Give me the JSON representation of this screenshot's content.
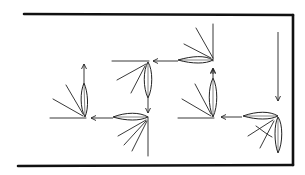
{
  "diagram": {
    "type": "path-diagram",
    "colors": {
      "ink": "#222222",
      "frame": "#111111",
      "background": "#ffffff"
    },
    "frame": {
      "sides": [
        "top",
        "right",
        "bottom"
      ],
      "open_side": "left"
    },
    "nodes": [
      {
        "id": "leaf-1",
        "orientation": "horizontal",
        "pivot": [
          213,
          60
        ],
        "arrow_direction": "left",
        "rays": 2
      },
      {
        "id": "leaf-2",
        "orientation": "vertical-down",
        "pivot": [
          148,
          62
        ],
        "arrow_direction": "down",
        "rays": 2
      },
      {
        "id": "leaf-3",
        "orientation": "horizontal",
        "pivot": [
          148,
          117
        ],
        "arrow_direction": "left",
        "rays": 3
      },
      {
        "id": "leaf-4",
        "orientation": "vertical-up",
        "pivot": [
          85,
          117
        ],
        "arrow_direction": "up",
        "rays": 2
      },
      {
        "id": "leaf-5",
        "orientation": "vertical-up",
        "pivot": [
          213,
          117
        ],
        "arrow_direction": "up",
        "rays": 2
      },
      {
        "id": "leaf-6",
        "orientation": "corner",
        "pivot": [
          278,
          116
        ],
        "arrow_direction": "left",
        "rays": 3
      }
    ],
    "entry_arrow": {
      "direction": "down",
      "from": [
        278,
        32
      ],
      "to": [
        278,
        100
      ]
    }
  }
}
